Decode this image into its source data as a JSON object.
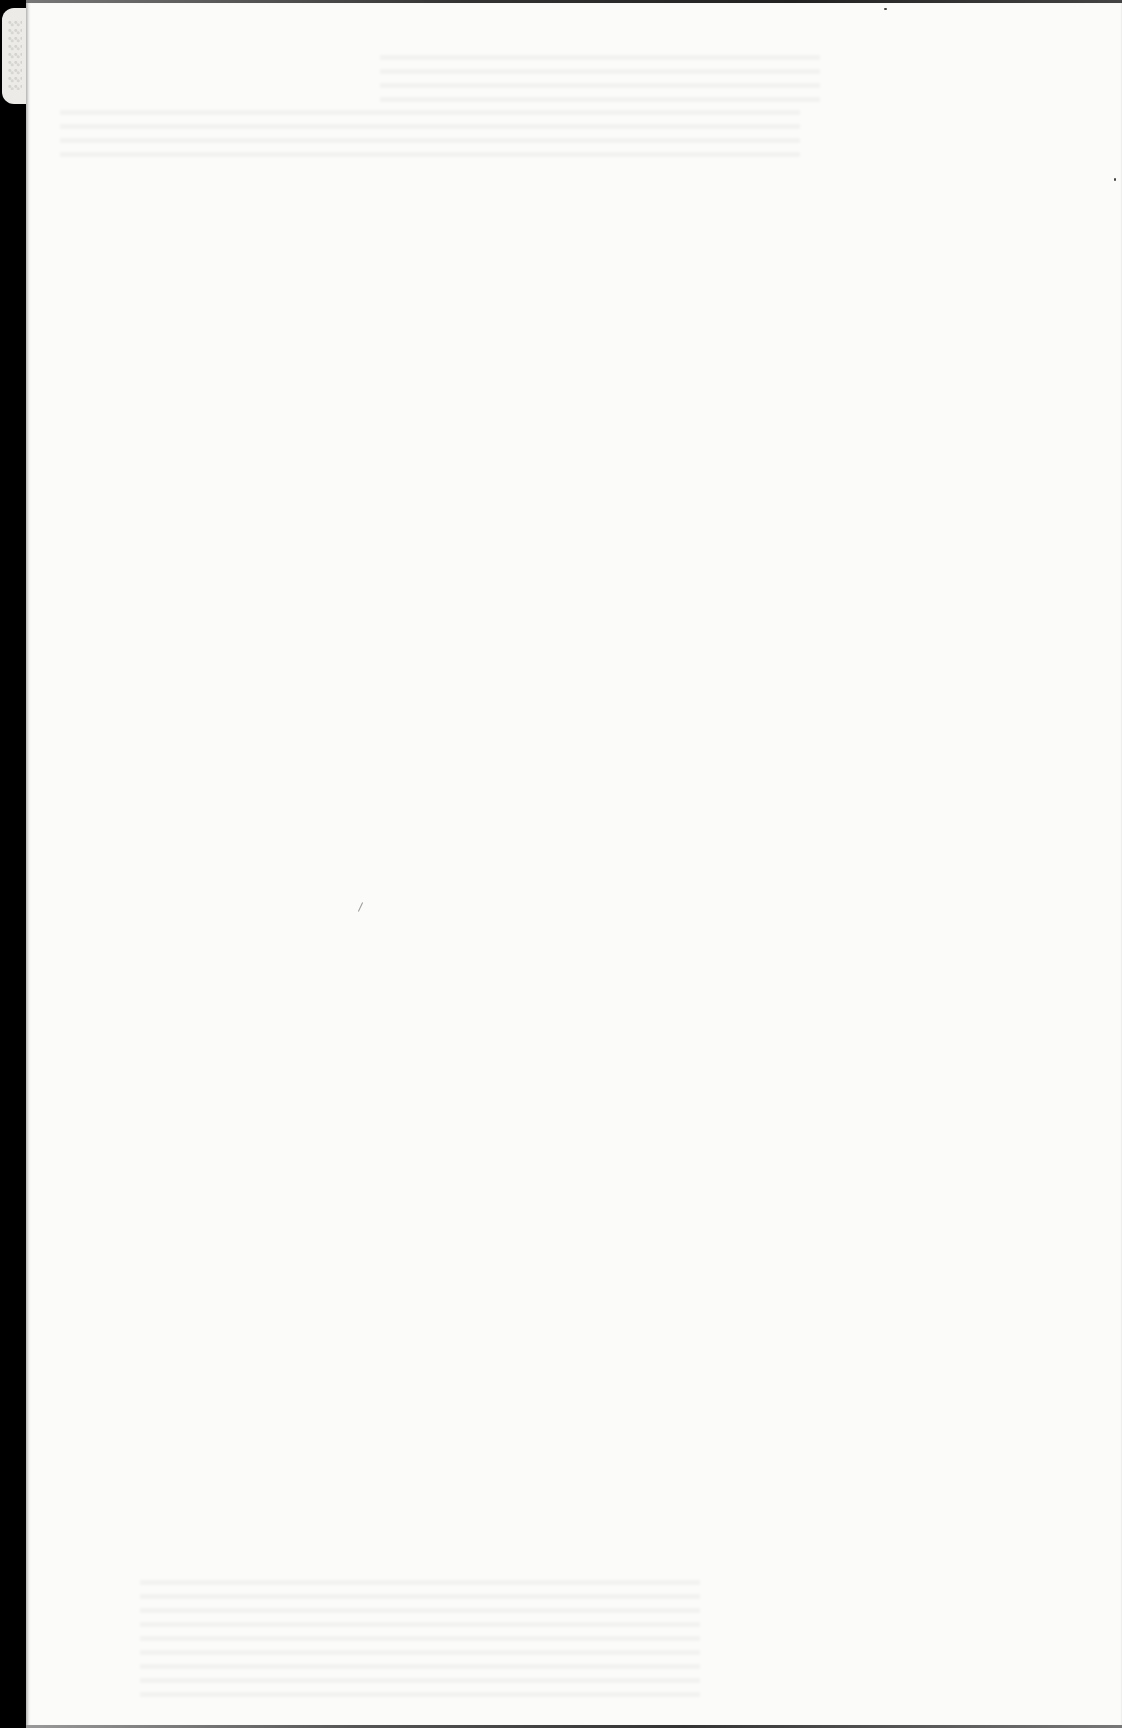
{
  "document": {
    "type": "scanned-page",
    "state": "blank",
    "legible_text": [],
    "colors": {
      "paper": "#fbfbfa",
      "scanner_background": "#000000",
      "tab": "#ecebe8"
    }
  }
}
